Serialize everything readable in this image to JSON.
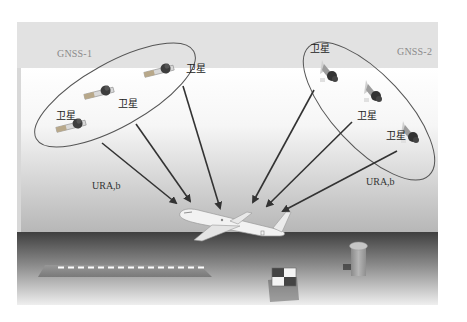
{
  "diagram": {
    "groups": [
      {
        "id": "gnss1",
        "label": "GNSS-1",
        "satellites": [
          {
            "label": "卫星"
          },
          {
            "label": "卫星"
          },
          {
            "label": "卫星"
          }
        ],
        "signal_label": "URA,b"
      },
      {
        "id": "gnss2",
        "label": "GNSS-2",
        "satellites": [
          {
            "label": "卫星"
          },
          {
            "label": "卫星"
          },
          {
            "label": "卫星"
          }
        ],
        "signal_label": "URA,b"
      }
    ],
    "ground_objects": [
      "aircraft",
      "runway",
      "reference-station",
      "control-tower"
    ],
    "colors": {
      "frame_band": "#e3e3e3",
      "sky_top": "#ffffff",
      "sky_bottom": "#b9b9b9",
      "ground_top": "#4a4a4a",
      "ground_bottom": "#eeeeee",
      "arrow": "#3a3a3a",
      "ellipse": "#555555",
      "runway_dash": "#ffffff"
    }
  }
}
